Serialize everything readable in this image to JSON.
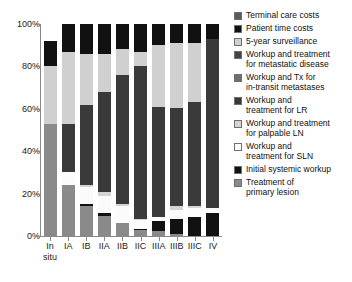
{
  "chart_data": {
    "type": "bar",
    "stacked": true,
    "title": "",
    "xlabel": "",
    "ylabel": "",
    "ylim": [
      0,
      100
    ],
    "ytick_labels": [
      "0%",
      "20%",
      "40%",
      "60%",
      "80%",
      "100%"
    ],
    "ytick_values": [
      0,
      20,
      40,
      60,
      80,
      100
    ],
    "grid": false,
    "legend_position": "right",
    "categories": [
      "In situ",
      "IA",
      "IB",
      "IIA",
      "IIB",
      "IIC",
      "IIIA",
      "IIIB",
      "IIIC",
      "IV"
    ],
    "category_lines": [
      [
        "In",
        "situ"
      ],
      [
        "IA"
      ],
      [
        "IB"
      ],
      [
        "IIA"
      ],
      [
        "IIB"
      ],
      [
        "IIC"
      ],
      [
        "IIIA"
      ],
      [
        "IIIB"
      ],
      [
        "IIIC"
      ],
      [
        "IV"
      ]
    ],
    "series": [
      {
        "name": "Treatment of primary lesion",
        "color": "#8a8a8a",
        "values": [
          53.0,
          24.0,
          14.0,
          9.5,
          6.0,
          3.0,
          2.5,
          1.0,
          0.0,
          0.0
        ]
      },
      {
        "name": "Initial systemic workup",
        "color": "#111111",
        "values": [
          0.0,
          0.0,
          1.0,
          1.5,
          0.0,
          0.5,
          4.5,
          7.0,
          9.0,
          11.0
        ]
      },
      {
        "name": "Workup and treatment for SLN",
        "color": "#fbfbfb",
        "values": [
          0.0,
          6.0,
          8.0,
          8.0,
          8.0,
          4.0,
          2.0,
          4.5,
          4.0,
          2.0
        ]
      },
      {
        "name": "Workup and treatment for palpable LN",
        "color": "#d4d4d4",
        "values": [
          0.0,
          0.0,
          1.0,
          2.0,
          1.0,
          0.5,
          0.0,
          1.5,
          1.0,
          0.0
        ]
      },
      {
        "name": "Workup and treatment for LR",
        "color": "#3a3a3a",
        "values": [
          0.0,
          23.0,
          38.0,
          47.0,
          61.0,
          72.0,
          52.0,
          46.5,
          49.0,
          80.0
        ]
      },
      {
        "name": "Workup and Tx for in-transit metastases",
        "color": "#6e6e6e",
        "values": [
          0.0,
          0.0,
          0.0,
          0.0,
          0.0,
          0.0,
          0.0,
          0.0,
          0.0,
          0.0
        ]
      },
      {
        "name": "Workup and treatment for metastatic disease",
        "color": "#444444",
        "values": [
          0.0,
          0.0,
          0.0,
          0.0,
          0.0,
          0.0,
          0.0,
          0.0,
          0.0,
          0.0
        ]
      },
      {
        "name": "5-year surveillance",
        "color": "#d0d0d0",
        "values": [
          27.0,
          34.0,
          24.0,
          18.0,
          12.0,
          7.0,
          29.0,
          30.5,
          28.0,
          0.0
        ]
      },
      {
        "name": "Patient time costs",
        "color": "#111111",
        "values": [
          12.0,
          13.0,
          14.0,
          14.0,
          12.0,
          13.0,
          10.0,
          9.0,
          9.0,
          7.0
        ]
      },
      {
        "name": "Terminal care costs",
        "color": "#5a5a5a",
        "values": [
          0.0,
          0.0,
          0.0,
          0.0,
          0.0,
          0.0,
          0.0,
          0.0,
          0.0,
          0.0
        ]
      }
    ]
  },
  "legend": {
    "items": [
      {
        "label": "Terminal care costs",
        "color": "#5a5a5a"
      },
      {
        "label": "Patient time costs",
        "color": "#111111"
      },
      {
        "label": "5-year surveillance",
        "color": "#d0d0d0"
      },
      {
        "label": "Workup and treatment\nfor metastatic disease",
        "color": "#444444"
      },
      {
        "label": "Workup and Tx for\nin-transit metastases",
        "color": "#6e6e6e"
      },
      {
        "label": "Workup and\ntreatment for LR",
        "color": "#3a3a3a"
      },
      {
        "label": "Workup and treatment\nfor palpable LN",
        "color": "#d4d4d4"
      },
      {
        "label": "Workup and\ntreatment for SLN",
        "color": "#fbfbfb"
      },
      {
        "label": "Initial systemic workup",
        "color": "#111111"
      },
      {
        "label": "Treatment of\nprimary lesion",
        "color": "#8a8a8a"
      }
    ]
  }
}
